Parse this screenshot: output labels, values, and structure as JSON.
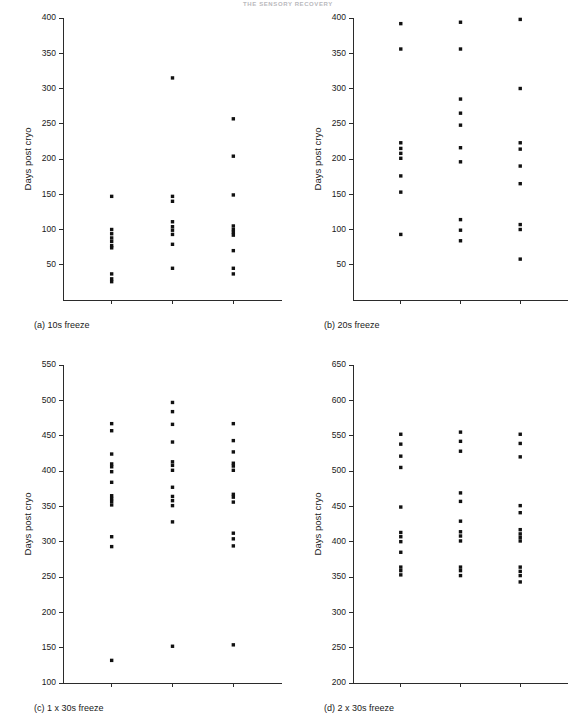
{
  "running_head": "THE SENSORY RECOVERY",
  "figure": {
    "y_axis_title": "Days post cryo",
    "categories": [
      "Touch",
      "Pain",
      "Cold"
    ]
  },
  "panels": [
    {
      "id": "panel-a",
      "caption": "(a) 10s freeze",
      "ylim": [
        0,
        400
      ],
      "yticks": [
        50,
        100,
        150,
        200,
        250,
        300,
        350,
        400
      ]
    },
    {
      "id": "panel-b",
      "caption": "(b) 20s freeze",
      "ylim": [
        0,
        400
      ],
      "yticks": [
        50,
        100,
        150,
        200,
        250,
        300,
        350,
        400
      ]
    },
    {
      "id": "panel-c",
      "caption": "(c) 1 x 30s freeze",
      "ylim": [
        100,
        550
      ],
      "yticks": [
        100,
        150,
        200,
        250,
        300,
        350,
        400,
        450,
        500,
        550
      ]
    },
    {
      "id": "panel-d",
      "caption": "(d) 2 x 30s freeze",
      "ylim": [
        200,
        650
      ],
      "yticks": [
        200,
        250,
        300,
        350,
        400,
        450,
        500,
        550,
        600,
        650
      ]
    }
  ],
  "chart_data": [
    {
      "type": "scatter",
      "panel": "a",
      "title": "(a) 10s freeze",
      "xlabel": "",
      "ylabel": "Days post cryo",
      "ylim": [
        0,
        400
      ],
      "yticks": [
        50,
        100,
        150,
        200,
        250,
        300,
        350,
        400
      ],
      "grid": false,
      "legend": "none",
      "categories": [
        "Touch",
        "Pain",
        "Cold"
      ],
      "series": [
        {
          "name": "Touch",
          "values": [
            147,
            100,
            94,
            88,
            83,
            77,
            74,
            37,
            30,
            26
          ]
        },
        {
          "name": "Pain",
          "values": [
            315,
            147,
            140,
            111,
            104,
            99,
            93,
            79,
            45
          ]
        },
        {
          "name": "Cold",
          "values": [
            257,
            204,
            149,
            105,
            100,
            96,
            92,
            70,
            45,
            37
          ]
        }
      ]
    },
    {
      "type": "scatter",
      "panel": "b",
      "title": "(b) 20s freeze",
      "xlabel": "",
      "ylabel": "Days post cryo",
      "ylim": [
        0,
        400
      ],
      "yticks": [
        50,
        100,
        150,
        200,
        250,
        300,
        350,
        400
      ],
      "grid": false,
      "legend": "none",
      "categories": [
        "Touch",
        "Pain",
        "Cold"
      ],
      "series": [
        {
          "name": "Touch",
          "values": [
            392,
            356,
            223,
            215,
            208,
            201,
            176,
            153,
            93
          ]
        },
        {
          "name": "Pain",
          "values": [
            394,
            356,
            285,
            265,
            248,
            216,
            196,
            114,
            99,
            84
          ]
        },
        {
          "name": "Cold",
          "values": [
            398,
            300,
            223,
            214,
            190,
            165,
            107,
            100,
            58
          ]
        }
      ]
    },
    {
      "type": "scatter",
      "panel": "c",
      "title": "(c) 1 x 30s freeze",
      "xlabel": "",
      "ylabel": "Days post cryo",
      "ylim": [
        100,
        550
      ],
      "yticks": [
        100,
        150,
        200,
        250,
        300,
        350,
        400,
        450,
        500,
        550
      ],
      "grid": false,
      "legend": "none",
      "categories": [
        "Touch",
        "Pain",
        "Cold"
      ],
      "series": [
        {
          "name": "Touch",
          "values": [
            467,
            457,
            424,
            410,
            406,
            399,
            384,
            365,
            361,
            357,
            352,
            307,
            293,
            132
          ]
        },
        {
          "name": "Pain",
          "values": [
            497,
            484,
            466,
            441,
            413,
            408,
            401,
            377,
            364,
            358,
            351,
            328,
            152
          ]
        },
        {
          "name": "Cold",
          "values": [
            467,
            443,
            427,
            411,
            407,
            401,
            367,
            363,
            356,
            312,
            304,
            294,
            154
          ]
        }
      ]
    },
    {
      "type": "scatter",
      "panel": "d",
      "title": "(d) 2 x 30s freeze",
      "xlabel": "",
      "ylabel": "Days post cryo",
      "ylim": [
        200,
        650
      ],
      "yticks": [
        200,
        250,
        300,
        350,
        400,
        450,
        500,
        550,
        600,
        650
      ],
      "grid": false,
      "legend": "none",
      "categories": [
        "Touch",
        "Pain",
        "Cold"
      ],
      "series": [
        {
          "name": "Touch",
          "values": [
            552,
            538,
            521,
            505,
            449,
            413,
            407,
            400,
            385,
            364,
            359,
            353
          ]
        },
        {
          "name": "Pain",
          "values": [
            555,
            542,
            528,
            469,
            457,
            429,
            414,
            408,
            401,
            364,
            359,
            352
          ]
        },
        {
          "name": "Cold",
          "values": [
            552,
            539,
            520,
            451,
            441,
            417,
            411,
            406,
            401,
            364,
            358,
            352,
            343
          ]
        }
      ]
    }
  ]
}
